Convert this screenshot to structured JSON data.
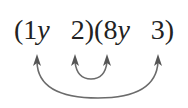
{
  "expression": {
    "open1": "(",
    "a_coef": "1",
    "a_var": "y",
    "gap1": "   ",
    "b": "2",
    "close_open": ")(",
    "c_coef": "8",
    "c_var": "y",
    "gap2": "   ",
    "d": "3",
    "close2": ")"
  },
  "arrows": {
    "color": "#666666",
    "outer": {
      "from": "1y",
      "to": "3",
      "label": "outer product"
    },
    "inner": {
      "from": "2",
      "to": "8y",
      "label": "inner product"
    }
  }
}
